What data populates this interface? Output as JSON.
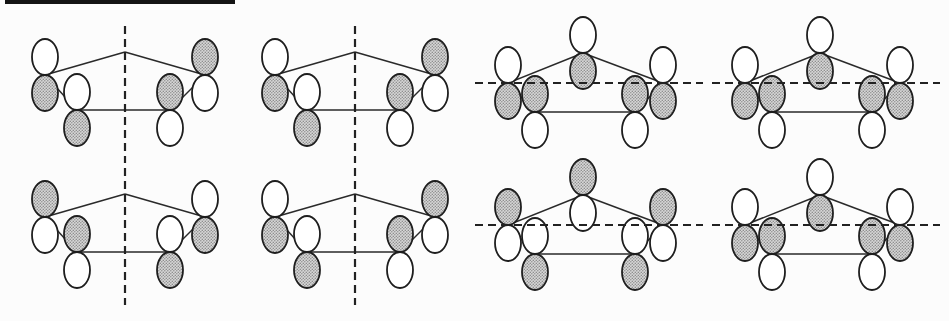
{
  "page": {
    "background": "#fcfcfc",
    "top_rule": {
      "x": 5,
      "y": 0,
      "width": 230,
      "height": 4,
      "color": "#141414"
    }
  },
  "figure": {
    "type": "molecular-orbital-symmetry-diagrams",
    "canvas": {
      "width": 949,
      "height": 321
    },
    "colors": {
      "outline": "#1e1e1e",
      "bond_line": "#2a2a2a",
      "symmetry_dash": "#222222",
      "unshaded_lobe": "#ffffff",
      "shaded_lobe_base": "#d7d7d7",
      "shaded_lobe_dot": "#8d8d8d"
    },
    "stroke": {
      "lobe_width": 1.8,
      "bond_width": 1.5,
      "dash_width": 2.2,
      "dash_array": "8 5"
    },
    "grid": {
      "column_x": [
        5,
        235,
        465,
        702
      ],
      "row_y": [
        8,
        150
      ]
    },
    "lobe": {
      "rx": 13,
      "ry": 18,
      "offset": 18
    },
    "templates": {
      "four_orbital": {
        "vertices": {
          "apex": [
            120,
            44
          ],
          "outer_left": [
            40,
            67
          ],
          "inner_left": [
            72,
            102
          ],
          "inner_right": [
            165,
            102
          ],
          "outer_right": [
            200,
            67
          ]
        },
        "edges": [
          [
            "apex",
            "outer_left"
          ],
          [
            "apex",
            "outer_right"
          ],
          [
            "outer_left",
            "inner_left"
          ],
          [
            "outer_right",
            "inner_right"
          ],
          [
            "inner_left",
            "inner_right"
          ]
        ],
        "symmetry_line": {
          "orientation": "vertical",
          "x": 120,
          "y1": 18,
          "y2": 155
        }
      },
      "five_orbital": {
        "vertices": {
          "apex": [
            118,
            45
          ],
          "outer_left": [
            43,
            75
          ],
          "inner_left": [
            70,
            104
          ],
          "inner_right": [
            170,
            104
          ],
          "outer_right": [
            198,
            75
          ]
        },
        "edges": [
          [
            "apex",
            "outer_left"
          ],
          [
            "apex",
            "outer_right"
          ],
          [
            "outer_left",
            "inner_left"
          ],
          [
            "outer_right",
            "inner_right"
          ],
          [
            "inner_left",
            "inner_right"
          ]
        ],
        "symmetry_line": {
          "orientation": "horizontal",
          "y": 75,
          "x1": 10,
          "x2": 238
        }
      }
    },
    "diagrams": [
      {
        "name": "mo-diagram-row1-col1",
        "row": 0,
        "col": 0,
        "template": "four_orbital",
        "lobes": {
          "outer_left": [
            "unshaded",
            "shaded"
          ],
          "inner_left": [
            "unshaded",
            "shaded"
          ],
          "inner_right": [
            "shaded",
            "unshaded"
          ],
          "outer_right": [
            "shaded",
            "unshaded"
          ]
        }
      },
      {
        "name": "mo-diagram-row1-col2",
        "row": 0,
        "col": 1,
        "template": "four_orbital",
        "lobes": {
          "outer_left": [
            "unshaded",
            "shaded"
          ],
          "inner_left": [
            "unshaded",
            "shaded"
          ],
          "inner_right": [
            "shaded",
            "unshaded"
          ],
          "outer_right": [
            "shaded",
            "unshaded"
          ]
        }
      },
      {
        "name": "mo-diagram-row1-col3",
        "row": 0,
        "col": 2,
        "template": "five_orbital",
        "lobes": {
          "outer_left": [
            "unshaded",
            "shaded"
          ],
          "inner_left": [
            "shaded",
            "unshaded"
          ],
          "inner_right": [
            "shaded",
            "unshaded"
          ],
          "outer_right": [
            "unshaded",
            "shaded"
          ],
          "apex": [
            "unshaded",
            "shaded"
          ]
        }
      },
      {
        "name": "mo-diagram-row1-col4",
        "row": 0,
        "col": 3,
        "template": "five_orbital",
        "lobes": {
          "outer_left": [
            "unshaded",
            "shaded"
          ],
          "inner_left": [
            "shaded",
            "unshaded"
          ],
          "inner_right": [
            "shaded",
            "unshaded"
          ],
          "outer_right": [
            "unshaded",
            "shaded"
          ],
          "apex": [
            "unshaded",
            "shaded"
          ]
        }
      },
      {
        "name": "mo-diagram-row2-col1",
        "row": 1,
        "col": 0,
        "template": "four_orbital",
        "lobes": {
          "outer_left": [
            "shaded",
            "unshaded"
          ],
          "inner_left": [
            "shaded",
            "unshaded"
          ],
          "inner_right": [
            "unshaded",
            "shaded"
          ],
          "outer_right": [
            "unshaded",
            "shaded"
          ]
        }
      },
      {
        "name": "mo-diagram-row2-col2",
        "row": 1,
        "col": 1,
        "template": "four_orbital",
        "lobes": {
          "outer_left": [
            "unshaded",
            "shaded"
          ],
          "inner_left": [
            "unshaded",
            "shaded"
          ],
          "inner_right": [
            "shaded",
            "unshaded"
          ],
          "outer_right": [
            "shaded",
            "unshaded"
          ]
        }
      },
      {
        "name": "mo-diagram-row2-col3",
        "row": 1,
        "col": 2,
        "template": "five_orbital",
        "lobes": {
          "outer_left": [
            "shaded",
            "unshaded"
          ],
          "inner_left": [
            "unshaded",
            "shaded"
          ],
          "inner_right": [
            "unshaded",
            "shaded"
          ],
          "outer_right": [
            "shaded",
            "unshaded"
          ],
          "apex": [
            "shaded",
            "unshaded"
          ]
        }
      },
      {
        "name": "mo-diagram-row2-col4",
        "row": 1,
        "col": 3,
        "template": "five_orbital",
        "lobes": {
          "outer_left": [
            "unshaded",
            "shaded"
          ],
          "inner_left": [
            "shaded",
            "unshaded"
          ],
          "inner_right": [
            "shaded",
            "unshaded"
          ],
          "outer_right": [
            "unshaded",
            "shaded"
          ],
          "apex": [
            "unshaded",
            "shaded"
          ]
        }
      }
    ]
  }
}
